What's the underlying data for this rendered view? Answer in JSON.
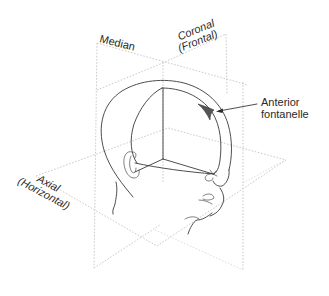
{
  "figure": {
    "planes": {
      "median": {
        "label": "Median"
      },
      "coronal": {
        "label_line1": "Coronal",
        "label_line2": "(Frontal)"
      },
      "axial": {
        "label_line1": "Axial",
        "label_line2": "(Horizontal)"
      }
    },
    "annotation": {
      "line1": "Anterior",
      "line2": "fontanelle"
    },
    "colors": {
      "ink": "#3a3a3a",
      "plane_dash": "#c4c4c4",
      "fontanelle_fill": "#555555"
    }
  }
}
